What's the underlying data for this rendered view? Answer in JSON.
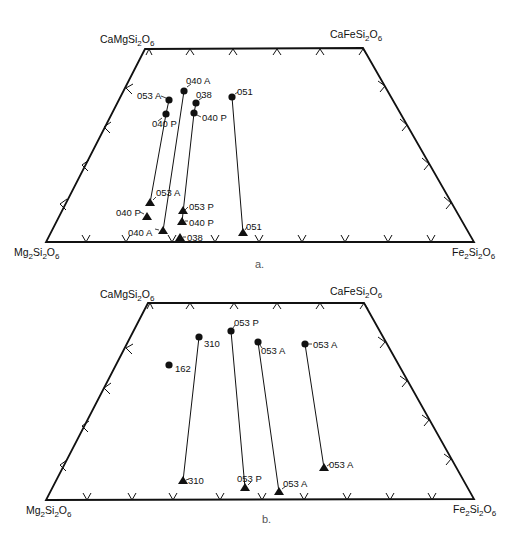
{
  "figure": {
    "panels": [
      {
        "id": "a",
        "caption": "a.",
        "corners": {
          "top_left": {
            "label": "CaMgSi₂O₆",
            "x": 145,
            "y": 49
          },
          "top_right": {
            "label": "CaFeSi₂O₆",
            "x": 363,
            "y": 48
          },
          "bottom_left": {
            "label": "Mg₂Si₂O₆",
            "x": 46,
            "y": 242
          },
          "bottom_right": {
            "label": "Fe₂Si₂O₆",
            "x": 474,
            "y": 242
          }
        },
        "tie_lines": [
          {
            "sample": "053 A",
            "circle": {
              "x": 169,
              "y": 100,
              "label": "053 A"
            },
            "triangle": {
              "x": 150,
              "y": 203,
              "label": "053 A"
            }
          },
          {
            "sample": "040 P",
            "circle": {
              "x": 166,
              "y": 114,
              "label": "040 P"
            },
            "triangle": {
              "x": 147,
              "y": 217,
              "label": "040 P"
            }
          },
          {
            "sample": "040 A",
            "circle": {
              "x": 184,
              "y": 91,
              "label": "040 A"
            },
            "triangle": {
              "x": 163,
              "y": 231,
              "label": "040 A"
            }
          },
          {
            "sample": "038",
            "circle": {
              "x": 196,
              "y": 103,
              "label": "038"
            },
            "triangle": {
              "x": 180,
              "y": 238,
              "label": "038"
            }
          },
          {
            "sample": "040 P",
            "circle": {
              "x": 194,
              "y": 113,
              "label": "040 P"
            },
            "triangle": {
              "x": 182,
              "y": 222,
              "label": "040 P"
            }
          },
          {
            "sample": "053 P",
            "circle": null,
            "triangle": {
              "x": 183,
              "y": 211,
              "label": "053 P"
            }
          },
          {
            "sample": "051",
            "circle": {
              "x": 232,
              "y": 97,
              "label": "051"
            },
            "triangle": {
              "x": 243,
              "y": 233,
              "label": "051"
            }
          }
        ]
      },
      {
        "id": "b",
        "caption": "b.",
        "corners": {
          "top_left": {
            "label": "CaMgSi₂O₆",
            "x": 148,
            "y": 303
          },
          "top_right": {
            "label": "CaFeSi₂O₆",
            "x": 364,
            "y": 303
          },
          "bottom_left": {
            "label": "Mg₂Si₂O₆",
            "x": 46,
            "y": 500
          },
          "bottom_right": {
            "label": "Fe₂Si₂O₆",
            "x": 474,
            "y": 499
          }
        },
        "tie_lines": [
          {
            "sample": "310",
            "circle": {
              "x": 199,
              "y": 337,
              "label": "310"
            },
            "triangle": {
              "x": 183,
              "y": 481,
              "label": "310"
            }
          },
          {
            "sample": "162",
            "circle": {
              "x": 169,
              "y": 365,
              "label": "162"
            },
            "triangle": null
          },
          {
            "sample": "053 P",
            "circle": {
              "x": 231,
              "y": 331,
              "label": "053 P"
            },
            "triangle": {
              "x": 245,
              "y": 488,
              "label": "053 P"
            }
          },
          {
            "sample": "053 A",
            "circle": {
              "x": 258,
              "y": 342,
              "label": "053 A"
            },
            "triangle": {
              "x": 279,
              "y": 492,
              "label": "053 A"
            }
          },
          {
            "sample": "053 A",
            "circle": {
              "x": 305,
              "y": 344,
              "label": "053 A"
            },
            "triangle": {
              "x": 324,
              "y": 468,
              "label": "053 A"
            }
          }
        ]
      }
    ],
    "legend": {
      "circle": "Ca-rich pyroxene (augite)",
      "triangle": "Ca-poor pyroxene"
    },
    "colors": {
      "ink": "#111111",
      "caption": "#555555",
      "background": "#ffffff"
    }
  },
  "labels": {
    "a": {
      "tl": "CaMgSi",
      "tl_s1": "2",
      "tl_o": "O",
      "tl_s2": "6",
      "tr": "CaFeSi",
      "tr_s1": "2",
      "tr_o": "O",
      "tr_s2": "6",
      "bl": "Mg",
      "bl_s0": "2",
      "bl_si": "Si",
      "bl_s1": "2",
      "bl_o": "O",
      "bl_s2": "6",
      "br": "Fe",
      "br_s0": "2",
      "br_si": "Si",
      "br_s1": "2",
      "br_o": "O",
      "br_s2": "6",
      "caption": "a.",
      "c_053A": "053 A",
      "c_040P_l": "040 P",
      "c_040A": "040 A",
      "c_038": "038",
      "c_040P_r": "040 P",
      "c_051": "051",
      "t_053A": "053 A",
      "t_040P_l": "040 P",
      "t_040A": "040 A",
      "t_053P": "053 P",
      "t_040P_r": "040 P",
      "t_038": "038",
      "t_051": "051"
    },
    "b": {
      "tl": "CaMgSi",
      "tl_s1": "2",
      "tl_o": "O",
      "tl_s2": "6",
      "tr": "CaFeSi",
      "tr_s1": "2",
      "tr_o": "O",
      "tr_s2": "6",
      "bl": "Mg",
      "bl_s0": "2",
      "bl_si": "Si",
      "bl_s1": "2",
      "bl_o": "O",
      "bl_s2": "6",
      "br": "Fe",
      "br_s0": "2",
      "br_si": "Si",
      "br_s1": "2",
      "br_o": "O",
      "br_s2": "6",
      "caption": "b.",
      "c_310": "310",
      "c_162": "162",
      "c_053P": "053 P",
      "c_053A_1": "053 A",
      "c_053A_2": "053 A",
      "t_310": "310",
      "t_053P": "053 P",
      "t_053A_1": "053 A",
      "t_053A_2": "053 A"
    }
  }
}
